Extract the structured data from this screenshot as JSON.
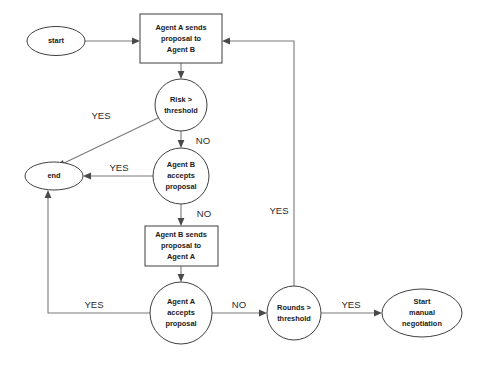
{
  "diagram": {
    "canvas": {
      "width": 479,
      "height": 366,
      "background": "#ffffff"
    },
    "style": {
      "shape_stroke": "#3f3f3f",
      "shape_fill": "#ffffff",
      "edge_stroke": "#7a7a7a",
      "arrow_fill": "#4a4a4a",
      "node_text_color": "#1a1a1a",
      "edge_label_color": "#2b2b2b"
    },
    "nodes": [
      {
        "id": "start",
        "shape": "ellipse",
        "label": "start",
        "lines": [
          "start"
        ]
      },
      {
        "id": "agent_a_sends",
        "shape": "rectangle",
        "label": "Agent A sends proposal to Agent B",
        "lines": [
          "Agent A sends",
          "proposal to",
          "Agent B"
        ]
      },
      {
        "id": "risk_threshold",
        "shape": "circle",
        "label": "Risk > threshold",
        "lines": [
          "Risk >",
          "threshold"
        ]
      },
      {
        "id": "end",
        "shape": "ellipse",
        "label": "end",
        "lines": [
          "end"
        ]
      },
      {
        "id": "agent_b_accepts",
        "shape": "circle",
        "label": "Agent B accepts proposal",
        "lines": [
          "Agent B",
          "accepts",
          "proposal"
        ]
      },
      {
        "id": "agent_b_sends",
        "shape": "rectangle",
        "label": "Agent B sends proposal to Agent A",
        "lines": [
          "Agent B sends",
          "proposal to",
          "Agent A"
        ]
      },
      {
        "id": "agent_a_accepts",
        "shape": "circle",
        "label": "Agent A accepts proposal",
        "lines": [
          "Agent A",
          "accepts",
          "proposal"
        ]
      },
      {
        "id": "rounds_threshold",
        "shape": "circle",
        "label": "Rounds > threshold",
        "lines": [
          "Rounds >",
          "threshold"
        ]
      },
      {
        "id": "start_manual",
        "shape": "ellipse",
        "label": "Start manual negotiation",
        "lines": [
          "Start",
          "manual",
          "negotiation"
        ]
      }
    ],
    "edges": [
      {
        "id": "e-start-agentasends",
        "from": "start",
        "to": "agent_a_sends",
        "label": ""
      },
      {
        "id": "e-agentasends-risk",
        "from": "agent_a_sends",
        "to": "risk_threshold",
        "label": ""
      },
      {
        "id": "e-risk-end",
        "from": "risk_threshold",
        "to": "end",
        "label": "YES"
      },
      {
        "id": "e-risk-agentbaccepts",
        "from": "risk_threshold",
        "to": "agent_b_accepts",
        "label": "NO"
      },
      {
        "id": "e-agentbaccepts-end",
        "from": "agent_b_accepts",
        "to": "end",
        "label": "YES"
      },
      {
        "id": "e-agentbaccepts-agentbsends",
        "from": "agent_b_accepts",
        "to": "agent_b_sends",
        "label": "NO"
      },
      {
        "id": "e-agentbsends-agentaaccepts",
        "from": "agent_b_sends",
        "to": "agent_a_accepts",
        "label": ""
      },
      {
        "id": "e-agentaaccepts-end",
        "from": "agent_a_accepts",
        "to": "end",
        "label": "YES"
      },
      {
        "id": "e-agentaaccepts-rounds",
        "from": "agent_a_accepts",
        "to": "rounds_threshold",
        "label": "NO"
      },
      {
        "id": "e-rounds-startmanual",
        "from": "rounds_threshold",
        "to": "start_manual",
        "label": "YES"
      },
      {
        "id": "e-rounds-agentasends",
        "from": "rounds_threshold",
        "to": "agent_a_sends",
        "label": "YES"
      }
    ],
    "node_text": {
      "start": {
        "l1": "start"
      },
      "agent_a_sends": {
        "l1": "Agent A sends",
        "l2": "proposal to",
        "l3": "Agent B"
      },
      "risk_threshold": {
        "l1": "Risk >",
        "l2": "threshold"
      },
      "end": {
        "l1": "end"
      },
      "agent_b_accepts": {
        "l1": "Agent B",
        "l2": "accepts",
        "l3": "proposal"
      },
      "agent_b_sends": {
        "l1": "Agent B sends",
        "l2": "proposal to",
        "l3": "Agent A"
      },
      "agent_a_accepts": {
        "l1": "Agent A",
        "l2": "accepts",
        "l3": "proposal"
      },
      "rounds_threshold": {
        "l1": "Rounds >",
        "l2": "threshold"
      },
      "start_manual": {
        "l1": "Start",
        "l2": "manual",
        "l3": "negotiation"
      }
    },
    "edge_labels": {
      "risk_yes": "YES",
      "risk_no": "NO",
      "agentb_yes": "YES",
      "agentb_no": "NO",
      "agenta_yes": "YES",
      "agenta_no": "NO",
      "rounds_yes_right": "YES",
      "rounds_yes_loop": "YES"
    }
  }
}
